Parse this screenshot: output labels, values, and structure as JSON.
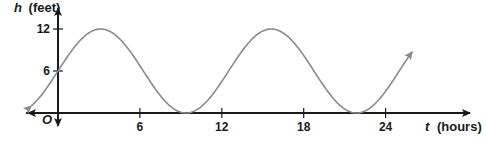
{
  "chart_data": {
    "type": "line",
    "title": "",
    "xlabel": "t (hours)",
    "ylabel": "h (feet)",
    "xlabel_var": "t",
    "xlabel_unit": "(hours)",
    "ylabel_var": "h",
    "ylabel_unit": "(feet)",
    "origin_label": "O",
    "x_ticks": [
      6,
      12,
      18,
      24
    ],
    "x_tick_labels": [
      "6",
      "12",
      "18",
      "24"
    ],
    "y_ticks": [
      6,
      12
    ],
    "y_tick_labels": [
      "6",
      "12"
    ],
    "xlim": [
      -4,
      31
    ],
    "ylim": [
      -3,
      14
    ],
    "grid": false,
    "series": [
      {
        "name": "h(t)",
        "description": "sinusoidal curve, midline 6, amplitude 6, period about 12.5 hours",
        "x": [
          -2,
          0,
          3.1,
          9.4,
          15.6,
          21.9,
          24,
          26
        ],
        "values": [
          1.3,
          6,
          12,
          0,
          12,
          0,
          4.3,
          9.9
        ]
      }
    ],
    "colors": {
      "curve": "#8a8a8a",
      "axes": "#1a1a1a"
    }
  }
}
